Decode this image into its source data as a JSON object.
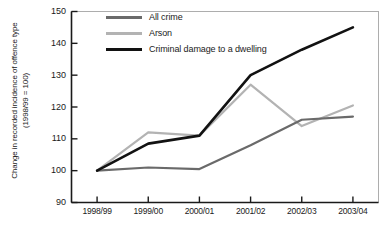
{
  "chart_data": {
    "type": "line",
    "title": "",
    "xlabel": "",
    "ylabel": "Change in recorded incidence of offence type\n(1998/99 = 100)",
    "categories": [
      "1998/99",
      "1999/00",
      "2000/01",
      "2001/02",
      "2002/03",
      "2003/04"
    ],
    "ylim": [
      90,
      150
    ],
    "yticks": [
      90,
      100,
      110,
      120,
      130,
      140,
      150
    ],
    "grid": false,
    "legend_position": "top-left",
    "series": [
      {
        "name": "All crime",
        "color": "#6a6a6a",
        "values": [
          100,
          101,
          100.5,
          108,
          116,
          117
        ]
      },
      {
        "name": "Arson",
        "color": "#b3b3b3",
        "values": [
          100,
          112,
          111,
          127,
          114,
          120.5
        ]
      },
      {
        "name": "Criminal damage to a dwelling",
        "color": "#121212",
        "values": [
          100,
          108.5,
          111,
          130,
          138,
          145
        ]
      }
    ]
  },
  "axis": {
    "y_title_line1": "Change in recorded incidence of offence type",
    "y_title_line2": "(1998/99 = 100)"
  }
}
